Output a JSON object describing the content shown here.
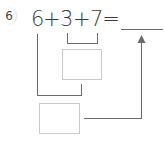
{
  "problem": {
    "number": "6",
    "terms": [
      "6",
      "3",
      "7"
    ],
    "operators": [
      "+",
      "+"
    ],
    "equals": "=",
    "answer": ""
  },
  "boxes": [
    {
      "name": "sum-3-plus-7-box",
      "value": ""
    },
    {
      "name": "sum-6-plus-result-box",
      "value": ""
    }
  ],
  "colors": {
    "line": "#6a6a6a",
    "box_border": "#c9c9c9",
    "text": "#3a3a3a"
  }
}
